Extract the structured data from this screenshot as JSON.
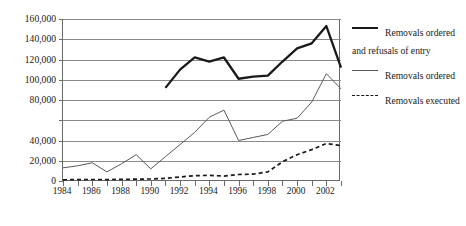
{
  "chart_data": {
    "type": "line",
    "title": "",
    "xlabel": "",
    "ylabel": "",
    "xlim": [
      1984,
      2003
    ],
    "ylim": [
      0,
      160000
    ],
    "grid": true,
    "legend_position": "right",
    "y_ticks": [
      0,
      20000,
      40000,
      60000,
      80000,
      100000,
      120000,
      140000,
      160000
    ],
    "y_tick_labels": [
      "0",
      "20,000",
      "40,000",
      "",
      "80,000",
      "100,000",
      "120,000",
      "140,000",
      "160,000"
    ],
    "x_ticks": [
      1984,
      1985,
      1986,
      1987,
      1988,
      1989,
      1990,
      1991,
      1992,
      1993,
      1994,
      1995,
      1996,
      1997,
      1998,
      1999,
      2000,
      2001,
      2002,
      2003
    ],
    "x_tick_labels": [
      "1984",
      "",
      "1986",
      "",
      "1988",
      "",
      "1990",
      "",
      "1992",
      "",
      "1994",
      "",
      "1996",
      "",
      "1998",
      "",
      "2000",
      "",
      "2002",
      ""
    ],
    "series": [
      {
        "name": "Removals ordered and refusals of entry",
        "style": "solid-thick",
        "color": "#1a1a1a",
        "x": [
          1991,
          1992,
          1993,
          1994,
          1995,
          1996,
          1997,
          1998,
          1999,
          2000,
          2001,
          2002,
          2003
        ],
        "values": [
          92000,
          110000,
          122000,
          118000,
          122000,
          101000,
          103000,
          104000,
          118000,
          131000,
          136000,
          153000,
          112000
        ]
      },
      {
        "name": "Removals ordered",
        "style": "solid-thin",
        "color": "#5a5a5a",
        "x": [
          1984,
          1985,
          1986,
          1987,
          1988,
          1989,
          1990,
          1991,
          1992,
          1993,
          1994,
          1995,
          1996,
          1997,
          1998,
          1999,
          2000,
          2001,
          2002,
          2003
        ],
        "values": [
          13000,
          15000,
          18000,
          9000,
          17000,
          26000,
          12000,
          24000,
          36000,
          48000,
          63000,
          70000,
          40000,
          43000,
          46000,
          59000,
          62000,
          78000,
          106000,
          91000
        ]
      },
      {
        "name": "Removals executed",
        "style": "dashed",
        "color": "#1a1a1a",
        "x": [
          1984,
          1985,
          1986,
          1987,
          1988,
          1989,
          1990,
          1991,
          1992,
          1993,
          1994,
          1995,
          1996,
          1997,
          1998,
          1999,
          2000,
          2001,
          2002,
          2003
        ],
        "values": [
          1200,
          1400,
          1500,
          1400,
          1600,
          1800,
          2000,
          2600,
          4000,
          5200,
          5600,
          4800,
          6400,
          6800,
          9000,
          19000,
          26000,
          31000,
          37000,
          35000
        ]
      }
    ]
  },
  "legend": {
    "items": [
      {
        "label": "Removals ordered and refusals of entry",
        "style": "solid-thick"
      },
      {
        "label": "Removals ordered",
        "style": "solid-thin"
      },
      {
        "label": "Removals executed",
        "style": "dashed"
      }
    ]
  }
}
